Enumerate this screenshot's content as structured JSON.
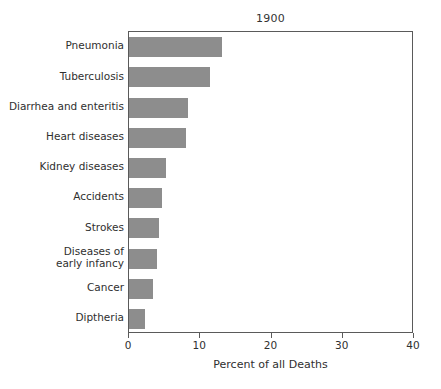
{
  "chart_data": {
    "type": "bar",
    "orientation": "horizontal",
    "title": "1900",
    "xlabel": "Percent of all Deaths",
    "ylabel": "",
    "xlim": [
      0,
      40
    ],
    "xticks": [
      0,
      10,
      20,
      30,
      40
    ],
    "xtick_labels": [
      "0",
      "10",
      "20",
      "30",
      "40"
    ],
    "grid": false,
    "legend": null,
    "bar_color": "#8d8d8d",
    "axis_color": "#5a5a5a",
    "categories": [
      "Pneumonia",
      "Tuberculosis",
      "Diarrhea and enteritis",
      "Heart diseases",
      "Kidney diseases",
      "Accidents",
      "Strokes",
      "Diseases of\nearly infancy",
      "Cancer",
      "Diptheria"
    ],
    "values": [
      13.0,
      11.3,
      8.3,
      8.0,
      5.2,
      4.6,
      4.2,
      3.9,
      3.4,
      2.3
    ]
  },
  "labels": {
    "cat_0": "Pneumonia",
    "cat_1": "Tuberculosis",
    "cat_2": "Diarrhea and enteritis",
    "cat_3": "Heart diseases",
    "cat_4": "Kidney diseases",
    "cat_5": "Accidents",
    "cat_6": "Strokes",
    "cat_7_line1": "Diseases of",
    "cat_7_line2": "early infancy",
    "cat_8": "Cancer",
    "cat_9": "Diptheria"
  },
  "axis": {
    "tick_0": "0",
    "tick_1": "10",
    "tick_2": "20",
    "tick_3": "30",
    "tick_4": "40",
    "title": "Percent of all Deaths"
  },
  "header": {
    "title": "1900"
  }
}
